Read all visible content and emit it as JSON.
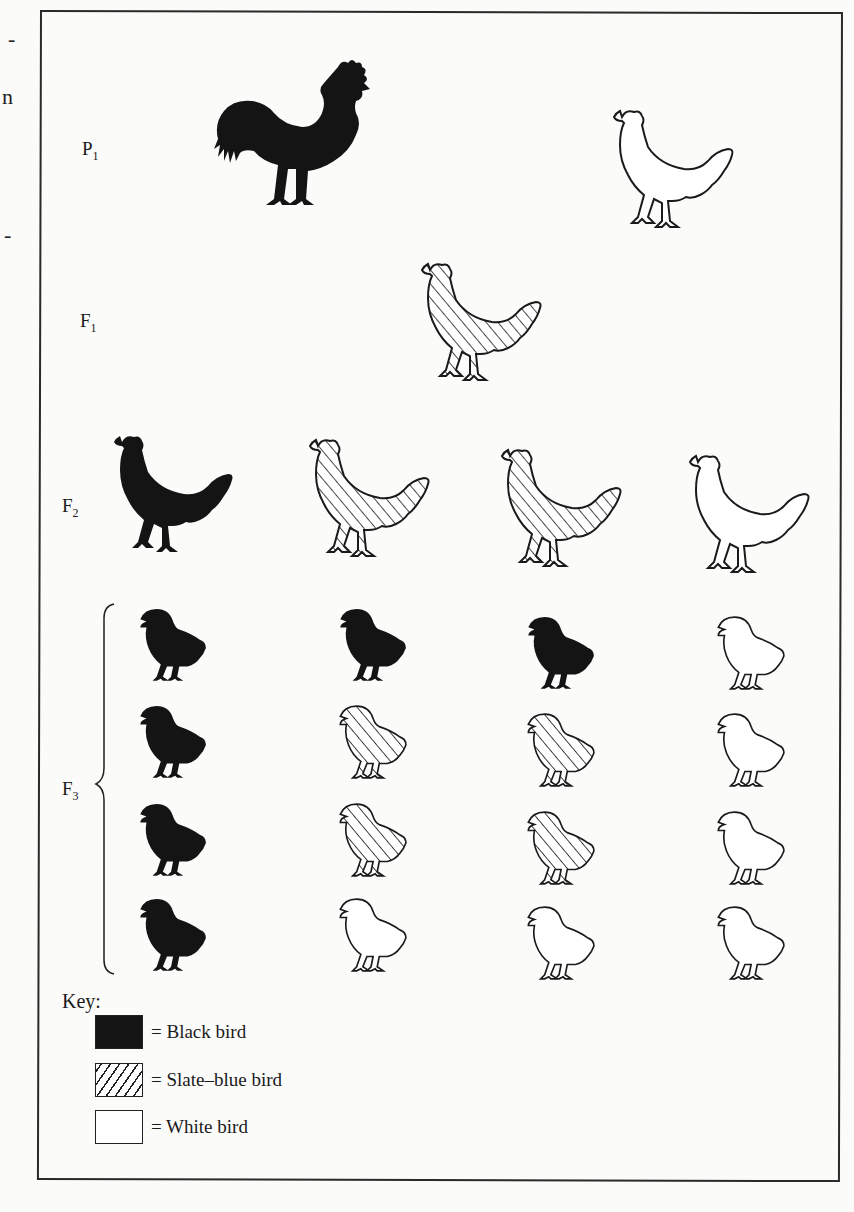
{
  "margin_fragments": [
    "-",
    "n",
    "-"
  ],
  "generations": [
    {
      "label": "P",
      "sub": "1"
    },
    {
      "label": "F",
      "sub": "1"
    },
    {
      "label": "F",
      "sub": "2"
    },
    {
      "label": "F",
      "sub": "3"
    }
  ],
  "birds": {
    "P1": [
      {
        "type": "rooster",
        "color": "black"
      },
      {
        "type": "hen",
        "color": "white"
      }
    ],
    "F1": [
      {
        "type": "hen",
        "color": "slate-blue"
      }
    ],
    "F2": [
      {
        "type": "hen",
        "color": "black"
      },
      {
        "type": "hen",
        "color": "slate-blue"
      },
      {
        "type": "hen",
        "color": "slate-blue"
      },
      {
        "type": "hen",
        "color": "white"
      }
    ],
    "F3": [
      [
        "black",
        "black",
        "black",
        "white"
      ],
      [
        "black",
        "slate-blue",
        "slate-blue",
        "white"
      ],
      [
        "black",
        "slate-blue",
        "slate-blue",
        "white"
      ],
      [
        "black",
        "white",
        "white",
        "white"
      ]
    ]
  },
  "key": {
    "title": "Key:",
    "items": [
      {
        "swatch": "black",
        "label": "= Black bird"
      },
      {
        "swatch": "hatch",
        "label": "= Slate–blue bird"
      },
      {
        "swatch": "white",
        "label": "= White bird"
      }
    ]
  },
  "colors": {
    "ink": "#141414",
    "paper": "#fbfbfa",
    "frame": "#2a2a2a"
  }
}
